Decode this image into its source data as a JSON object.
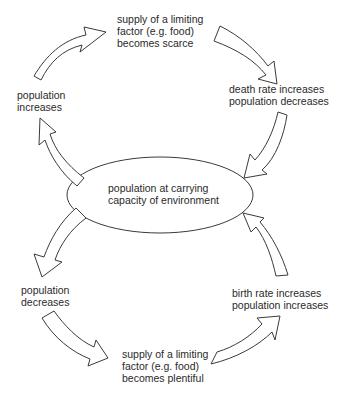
{
  "diagram": {
    "center": {
      "lines": [
        "population at carrying",
        "capacity of environment"
      ]
    },
    "nodes": [
      {
        "id": "top",
        "lines": [
          "supply of a limiting",
          "factor (e.g. food)",
          "becomes scarce"
        ]
      },
      {
        "id": "right-upper",
        "lines": [
          "death rate increases",
          "population decreases"
        ]
      },
      {
        "id": "left-upper",
        "lines": [
          "population",
          "increases"
        ]
      },
      {
        "id": "left-lower",
        "lines": [
          "population",
          "decreases"
        ]
      },
      {
        "id": "right-lower",
        "lines": [
          "birth rate increases",
          "population increases"
        ]
      },
      {
        "id": "bottom",
        "lines": [
          "supply of a limiting",
          "factor (e.g. food)",
          "becomes plentiful"
        ]
      }
    ],
    "colors": {
      "stroke": "#3a3a3a",
      "fill": "#ffffff",
      "text": "#2a2a2a"
    }
  }
}
